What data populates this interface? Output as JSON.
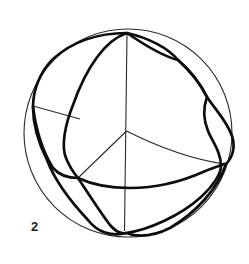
{
  "figure": {
    "label": "2"
  },
  "canvas": {
    "width": 249,
    "height": 264,
    "background": "#ffffff",
    "stroke_color_thin": "#2a2a2a",
    "stroke_color_thick": "#0d0d0d"
  },
  "diagram": {
    "type": "geometric-figure",
    "elements": [
      {
        "name": "sphere-outline-circle",
        "type": "circle",
        "cx": 128,
        "cy": 133,
        "r": 104,
        "class": "thin"
      },
      {
        "name": "vertical-axis-line",
        "type": "path",
        "d": "M127,33 L124.5,231",
        "class": "thin"
      },
      {
        "name": "left-axis-line",
        "type": "path",
        "d": "M33,106 L80,119",
        "class": "thin"
      },
      {
        "name": "right-axis-line",
        "type": "path",
        "d": "M126.5,131 Q178,157 224,164",
        "class": "thin"
      },
      {
        "name": "front-axis-line",
        "type": "path",
        "d": "M126.5,131 L78,178",
        "class": "thin"
      },
      {
        "name": "great-circle-vertical",
        "type": "path",
        "d": "M127,33 C105,40 86,68 73,105 C65,125 61,146 66,158 C70,168 73,172 78,178 C86,190 100,212 110,225 C116,232 122,234 126,233 C148,230 180,216 201,197 C213,186 221,174 221,166 C221,152 212,141 208,131 C204,121 203,108 207,97 C201,85 190,70 178,60 C162,56 143,44 127,33 Z",
        "class": "thick"
      },
      {
        "name": "great-circle-tilted",
        "type": "path",
        "d": "M127,33 C149,38 168,48 178,60 C190,71 201,85 207,97 C214,108 227,121 232,136 C236,148 232,158 226,164 C218,188 197,212 170,228 C156,235 140,238 126,233 C112,237 97,232 88,220 C72,203 55,181 47,160 C38,142 33,122 33,107 C33,90 40,72 53,59 C73,41 100,33 127,33 Z",
        "class": "thick"
      },
      {
        "name": "great-circle-horizontal",
        "type": "path",
        "d": "M33,107 C36,130 43,152 53,168 C60,176 70,178 78,178 C95,186 112,188 130,188 C158,188 185,180 203,172 C212,168 219,166 224,164",
        "class": "thick"
      }
    ]
  }
}
